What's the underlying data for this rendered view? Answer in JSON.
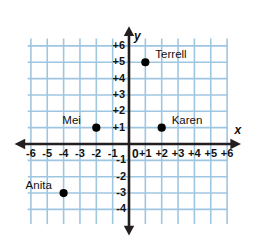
{
  "figure": {
    "type": "coordinate-plane",
    "background_color": "#ffffff",
    "grid_color": "#9fc6e0",
    "axis_color": "#231f20",
    "point_color": "#000000"
  },
  "axes": {
    "x_letter": "x",
    "y_letter": "y",
    "origin_label": "0",
    "x_ticks": [
      "-6",
      "-5",
      "-4",
      "-3",
      "-2",
      "-1",
      "+1",
      "+2",
      "+3",
      "+4",
      "+5",
      "+6"
    ],
    "x_tick_values": [
      -6,
      -5,
      -4,
      -3,
      -2,
      -1,
      1,
      2,
      3,
      4,
      5,
      6
    ],
    "y_ticks": [
      "+6",
      "+5",
      "+4",
      "+3",
      "+2",
      "+1",
      "-1",
      "-2",
      "-3",
      "-4"
    ],
    "y_tick_values": [
      6,
      5,
      4,
      3,
      2,
      1,
      -1,
      -2,
      -3,
      -4
    ]
  },
  "chart_data": {
    "type": "scatter",
    "title": "",
    "xlabel": "x",
    "ylabel": "y",
    "xlim": [
      -6.5,
      6.5
    ],
    "ylim": [
      -4.9,
      6.6
    ],
    "grid": true,
    "legend": "none",
    "points": [
      {
        "name": "Terrell",
        "x": 1,
        "y": 5,
        "label_dx": 10,
        "label_dy": -13
      },
      {
        "name": "Karen",
        "x": 2,
        "y": 1,
        "label_dx": 10,
        "label_dy": -13
      },
      {
        "name": "Mei",
        "x": -2,
        "y": 1,
        "label_dx": -34,
        "label_dy": -13
      },
      {
        "name": "Anita",
        "x": -4,
        "y": -3,
        "label_dx": -38,
        "label_dy": -13
      }
    ]
  }
}
